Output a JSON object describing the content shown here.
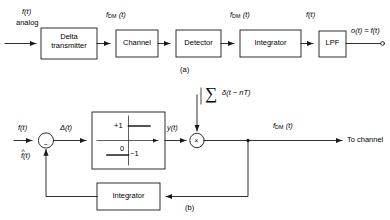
{
  "figure": {
    "title_a": "(a)",
    "title_b": "(b)"
  },
  "diagram_a": {
    "input_label_line1": "f(t)",
    "input_label_line2": "analog",
    "blocks": [
      {
        "id": "delta-transmitter",
        "line1": "Delta",
        "line2": "transmitter"
      },
      {
        "id": "channel",
        "line1": "Channel",
        "line2": ""
      },
      {
        "id": "detector",
        "line1": "Detector",
        "line2": ""
      },
      {
        "id": "integrator",
        "line1": "Integrator",
        "line2": ""
      },
      {
        "id": "lpf",
        "line1": "LPF",
        "line2": ""
      }
    ],
    "signal_after_transmitter": "fDM(t)",
    "signal_after_detector": "fDM(t)",
    "signal_after_integrator": "f(t)",
    "output_label": "o(t) ≈ f(t)"
  },
  "diagram_b": {
    "input_label": "f(t)",
    "feedback_label": "f̂(t)",
    "error_label": "Δ(t)",
    "summer_sign": "−",
    "quantizer": {
      "level_high": "+1",
      "level_zero": "0",
      "level_low": "−1"
    },
    "quantizer_output": "y(t)",
    "multiplier_glyph": "×",
    "pulse_train_label": "δ(t − nT)",
    "pulse_train_sigma": "∑",
    "output_signal": "fDM(t)",
    "output_destination": "To channel",
    "feedback_block": "Integrator"
  },
  "colors": {
    "stroke": "#1a1a1a",
    "background": "#ffffff",
    "text": "#000000"
  }
}
